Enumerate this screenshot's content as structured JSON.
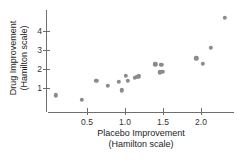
{
  "chart_data": {
    "type": "scatter",
    "title": "",
    "xlabel": "Placebo Improvement (Hamilton scale)",
    "xlabel_line1": "Placebo Improvement",
    "xlabel_line2": "(Hamilton scale)",
    "ylabel": "Drug Improvement (Hamilton scale)",
    "ylabel_line1": "Drug Improvement",
    "ylabel_line2": "(Hamilton scale)",
    "xticks": [
      0.5,
      1.0,
      1.5,
      2.0
    ],
    "xtick_labels": [
      "0.5",
      "1.0",
      "1.5",
      "2.0"
    ],
    "yticks": [
      1,
      2,
      3,
      4
    ],
    "ytick_labels": [
      "1",
      "2",
      "3",
      "4"
    ],
    "xlim": [
      0.08,
      2.45
    ],
    "ylim": [
      0.18,
      5.0
    ],
    "grid": false,
    "legend": null,
    "marker_color": "#8b8b8b",
    "axis_color": "#6e6e6e",
    "points": [
      {
        "x": 0.09,
        "y": 0.62
      },
      {
        "x": 0.43,
        "y": 0.38
      },
      {
        "x": 0.62,
        "y": 1.38
      },
      {
        "x": 0.77,
        "y": 1.12
      },
      {
        "x": 0.92,
        "y": 1.34
      },
      {
        "x": 0.96,
        "y": 0.88
      },
      {
        "x": 1.01,
        "y": 1.65
      },
      {
        "x": 1.04,
        "y": 1.37
      },
      {
        "x": 1.13,
        "y": 1.55
      },
      {
        "x": 1.16,
        "y": 1.6
      },
      {
        "x": 1.18,
        "y": 1.62
      },
      {
        "x": 1.4,
        "y": 2.25
      },
      {
        "x": 1.48,
        "y": 2.22
      },
      {
        "x": 1.46,
        "y": 1.82
      },
      {
        "x": 1.49,
        "y": 1.85
      },
      {
        "x": 1.94,
        "y": 2.57
      },
      {
        "x": 2.02,
        "y": 2.28
      },
      {
        "x": 2.13,
        "y": 3.1
      },
      {
        "x": 2.31,
        "y": 4.7
      }
    ]
  }
}
